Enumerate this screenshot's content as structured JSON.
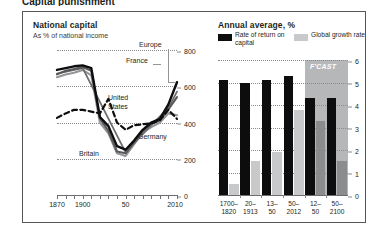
{
  "figure": {
    "cut_title": "Capital punishment",
    "background": "#ffffff",
    "border_color": "#55565a"
  },
  "left_panel": {
    "title": "National capital",
    "subtitle": "As % of national income"
  },
  "right_panel": {
    "title": "Annual average, %",
    "legend": [
      {
        "label": "Rate of return on capital",
        "color": "#0d0d0d",
        "name": "legend-rate-of-return"
      },
      {
        "label": "Global growth rate",
        "color": "#c8c9cb",
        "name": "legend-global-growth"
      }
    ],
    "forecast_label": "F'CAST"
  },
  "chart_data": [
    {
      "type": "line",
      "title": "National capital",
      "subtitle": "As % of national income",
      "xlabel": "",
      "ylabel": "As % of national income",
      "ylim": [
        0,
        800
      ],
      "yticks": [
        0,
        200,
        400,
        600,
        800
      ],
      "xlim": [
        1870,
        2010
      ],
      "xticks": [
        1870,
        1880,
        1890,
        1900,
        1910,
        1920,
        1930,
        1940,
        1950,
        1960,
        1970,
        1980,
        1990,
        2000,
        2010
      ],
      "xtick_labels": [
        {
          "x": 1870,
          "label": "1870"
        },
        {
          "x": 1900,
          "label": "1900"
        },
        {
          "x": 1950,
          "label": "50"
        },
        {
          "x": 2010,
          "label": "2010"
        }
      ],
      "grid": "dotted-horizontal",
      "legend_position": "inline-labels",
      "series": [
        {
          "name": "France",
          "color": "#0d0d0d",
          "style": "solid",
          "x": [
            1870,
            1880,
            1890,
            1900,
            1910,
            1920,
            1930,
            1940,
            1950,
            1960,
            1970,
            1980,
            1990,
            2000,
            2010
          ],
          "values": [
            690,
            700,
            710,
            715,
            700,
            430,
            380,
            270,
            250,
            300,
            360,
            400,
            420,
            500,
            620
          ]
        },
        {
          "name": "Britain",
          "color": "#58595b",
          "style": "solid",
          "x": [
            1870,
            1880,
            1890,
            1900,
            1910,
            1920,
            1930,
            1940,
            1950,
            1960,
            1970,
            1980,
            1990,
            2000,
            2010
          ],
          "values": [
            660,
            680,
            690,
            700,
            680,
            420,
            350,
            240,
            230,
            290,
            350,
            390,
            410,
            470,
            540
          ]
        },
        {
          "name": "Germany",
          "color": "#939598",
          "style": "solid",
          "x": [
            1870,
            1880,
            1890,
            1900,
            1910,
            1920,
            1930,
            1940,
            1950,
            1960,
            1970,
            1980,
            1990,
            2000,
            2010
          ],
          "values": [
            650,
            665,
            675,
            690,
            660,
            400,
            340,
            230,
            215,
            280,
            345,
            375,
            400,
            450,
            440
          ]
        },
        {
          "name": "Europe",
          "color": "#6d6e71",
          "style": "solid",
          "x": [
            1870,
            1900,
            1950,
            1980,
            2000,
            2010
          ],
          "values": [
            670,
            700,
            235,
            385,
            480,
            570
          ]
        },
        {
          "name": "United States",
          "color": "#0d0d0d",
          "style": "dashed",
          "x": [
            1870,
            1880,
            1890,
            1900,
            1910,
            1920,
            1930,
            1940,
            1950,
            1960,
            1970,
            1980,
            1990,
            2000,
            2010
          ],
          "values": [
            425,
            450,
            470,
            470,
            460,
            450,
            530,
            400,
            360,
            385,
            390,
            395,
            410,
            470,
            420
          ]
        }
      ],
      "series_labels": [
        {
          "name": "Europe",
          "label": "Europe"
        },
        {
          "name": "France",
          "label": "France"
        },
        {
          "name": "United States",
          "label": "United States"
        },
        {
          "name": "Germany",
          "label": "Germany"
        },
        {
          "name": "Britain",
          "label": "Britain"
        }
      ]
    },
    {
      "type": "bar",
      "title": "Annual average, %",
      "xlabel": "",
      "ylabel": "%",
      "ylim": [
        0,
        6
      ],
      "yticks": [
        0,
        1,
        2,
        3,
        4,
        5,
        6
      ],
      "grid": "dotted-horizontal",
      "legend_position": "top",
      "categories": [
        "1700–1820",
        "20–1913",
        "13–50",
        "50–2012",
        "12–50",
        "50–2100"
      ],
      "category_lines": [
        [
          "1700–",
          "1820"
        ],
        [
          "20–",
          "1913"
        ],
        [
          "13–",
          "50"
        ],
        [
          "50–",
          "2012"
        ],
        [
          "12–",
          "50"
        ],
        [
          "50–",
          "2100"
        ]
      ],
      "series": [
        {
          "name": "Rate of return on capital",
          "color": "#0d0d0d",
          "values": [
            5.1,
            5.0,
            5.1,
            5.3,
            4.3,
            4.3
          ]
        },
        {
          "name": "Global growth rate",
          "color": "#c8c9cb",
          "values": [
            0.5,
            1.5,
            1.9,
            3.8,
            3.3,
            1.5
          ]
        }
      ],
      "forecast": {
        "label": "F'CAST",
        "starts_at_category": "12–50",
        "band_color": "#b6b7b9"
      }
    }
  ]
}
